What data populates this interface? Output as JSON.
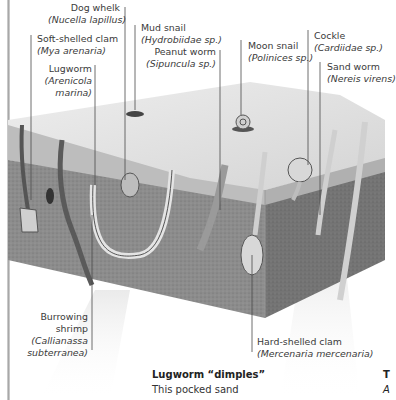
{
  "figure": {
    "type": "cross-section illustration",
    "labels": [
      {
        "id": "dog-whelk",
        "common": "Dog whelk",
        "scientific": "(Nucella lapillus)"
      },
      {
        "id": "mud-snail",
        "common": "Mud snail",
        "scientific": "(Hydrobiidae sp.)"
      },
      {
        "id": "soft-shelled-clam",
        "common": "Soft-shelled clam",
        "scientific": "(Mya arenaria)"
      },
      {
        "id": "peanut-worm",
        "common": "Peanut worm",
        "scientific": "(Sipuncula sp.)"
      },
      {
        "id": "moon-snail",
        "common": "Moon snail",
        "scientific": "(Polinices sp.)"
      },
      {
        "id": "cockle",
        "common": "Cockle",
        "scientific": "(Cardiidae sp.)"
      },
      {
        "id": "sand-worm",
        "common": "Sand worm",
        "scientific": "(Nereis virens)"
      },
      {
        "id": "lugworm",
        "common_lines": [
          "Lugworm"
        ],
        "scientific_lines": [
          "(Arenicola",
          "marina)"
        ]
      },
      {
        "id": "burrowing-shrimp",
        "common_lines": [
          "Burrowing",
          "shrimp"
        ],
        "scientific_lines": [
          "(Callianassa",
          "subterranea)"
        ]
      },
      {
        "id": "hard-shelled-clam",
        "common": "Hard-shelled clam",
        "scientific": "(Mercenaria mercenaria)"
      }
    ]
  },
  "caption": {
    "title": "Lugworm “dimples”",
    "body": "This pocked sand"
  },
  "side_text": {
    "line1": "T",
    "line2": "A"
  },
  "colors": {
    "surface": "#e6e6e6",
    "sediment_front": "#8a8a8a",
    "sediment_side": "#6e6e6e",
    "sand_layer": "#b9b9b9",
    "leader_line": "#4a4a4a"
  }
}
